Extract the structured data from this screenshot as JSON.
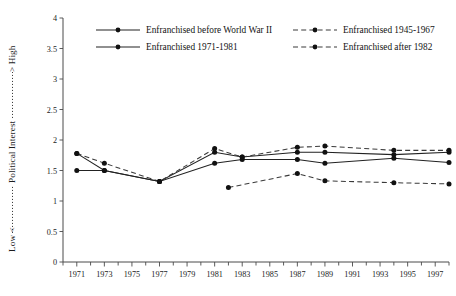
{
  "chart_data": {
    "type": "line",
    "title": "",
    "xlabel": "",
    "ylabel": "Political Interest",
    "ylabel_low": "Low <",
    "ylabel_high": "> High",
    "ylabel_full": "Low <------- Political Interest -------> High",
    "xlim": [
      1970,
      1998
    ],
    "ylim": [
      0,
      4
    ],
    "ytick_values": [
      0,
      0.5,
      1,
      1.5,
      2,
      2.5,
      3,
      3.5,
      4
    ],
    "ytick_labels": [
      "0",
      "0.5",
      "1",
      "1.5",
      "2",
      "2.5",
      "3",
      "3.5",
      "4"
    ],
    "xtick_values": [
      1971,
      1973,
      1975,
      1977,
      1979,
      1981,
      1983,
      1985,
      1987,
      1989,
      1991,
      1993,
      1995,
      1997
    ],
    "xtick_labels": [
      "1971",
      "1973",
      "1975",
      "1977",
      "1979",
      "1981",
      "1983",
      "1985",
      "1987",
      "1989",
      "1991",
      "1993",
      "1995",
      "1997"
    ],
    "xminor_values": [
      1970,
      1972,
      1974,
      1976,
      1978,
      1980,
      1982,
      1984,
      1986,
      1988,
      1990,
      1992,
      1994,
      1996,
      1998
    ],
    "grid": false,
    "legend_position": "top",
    "series": [
      {
        "name": "Enfranchised before World War II",
        "style": "solid",
        "x": [
          1971,
          1973,
          1977,
          1981,
          1983,
          1987,
          1989,
          1994,
          1998
        ],
        "values": [
          1.5,
          1.5,
          1.32,
          1.8,
          1.72,
          1.8,
          1.8,
          1.76,
          1.8
        ]
      },
      {
        "name": "Enfranchised 1945-1967",
        "style": "dashed",
        "x": [
          1971,
          1973,
          1977,
          1981,
          1983,
          1987,
          1989,
          1994,
          1998
        ],
        "values": [
          1.78,
          1.62,
          1.32,
          1.86,
          1.72,
          1.88,
          1.9,
          1.83,
          1.83
        ]
      },
      {
        "name": "Enfranchised 1971-1981",
        "style": "solid",
        "x": [
          1971,
          1973,
          1977,
          1981,
          1983,
          1987,
          1989,
          1994,
          1998
        ],
        "values": [
          1.78,
          1.5,
          1.32,
          1.62,
          1.68,
          1.68,
          1.62,
          1.7,
          1.63
        ]
      },
      {
        "name": "Enfranchised after 1982",
        "style": "dashed",
        "x": [
          1982,
          1987,
          1989,
          1994,
          1998
        ],
        "values": [
          1.22,
          1.45,
          1.33,
          1.3,
          1.28
        ]
      }
    ]
  },
  "legend": {
    "entries": [
      {
        "label": "Enfranchised before World War II",
        "style": "solid"
      },
      {
        "label": "Enfranchised 1945-1967",
        "style": "dashed"
      },
      {
        "label": "Enfranchised 1971-1981",
        "style": "solid"
      },
      {
        "label": "Enfranchised after 1982",
        "style": "dashed"
      }
    ]
  }
}
